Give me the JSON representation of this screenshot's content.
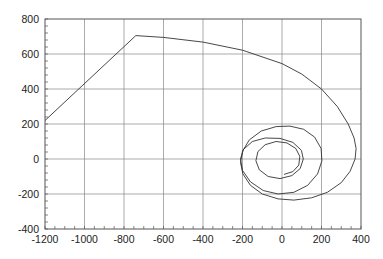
{
  "chart_data": {
    "type": "line",
    "title": "",
    "xlabel": "",
    "ylabel": "",
    "xlim": [
      -1200,
      400
    ],
    "ylim": [
      -400,
      800
    ],
    "xticks": [
      -1200,
      -1000,
      -800,
      -600,
      -400,
      -200,
      0,
      200,
      400
    ],
    "yticks": [
      -400,
      -200,
      0,
      200,
      400,
      600,
      800
    ],
    "x_minor_step": 50,
    "y_minor_step": 40,
    "grid": true,
    "legend": null,
    "colors": {
      "line": "#333333",
      "grid": "#888888",
      "frame": "#555555",
      "background": "#ffffff"
    },
    "series": [
      {
        "name": "trajectory",
        "points": [
          [
            -1200,
            220
          ],
          [
            -740,
            705
          ],
          [
            -600,
            695
          ],
          [
            -400,
            668
          ],
          [
            -200,
            622
          ],
          [
            0,
            545
          ],
          [
            100,
            485
          ],
          [
            200,
            400
          ],
          [
            280,
            300
          ],
          [
            335,
            200
          ],
          [
            365,
            120
          ],
          [
            375,
            60
          ],
          [
            370,
            0
          ],
          [
            345,
            -70
          ],
          [
            300,
            -135
          ],
          [
            230,
            -190
          ],
          [
            150,
            -222
          ],
          [
            60,
            -235
          ],
          [
            -20,
            -228
          ],
          [
            -100,
            -200
          ],
          [
            -160,
            -150
          ],
          [
            -198,
            -85
          ],
          [
            -210,
            -20
          ],
          [
            -200,
            45
          ],
          [
            -165,
            110
          ],
          [
            -105,
            160
          ],
          [
            -30,
            185
          ],
          [
            40,
            188
          ],
          [
            110,
            170
          ],
          [
            165,
            125
          ],
          [
            198,
            60
          ],
          [
            202,
            -10
          ],
          [
            180,
            -85
          ],
          [
            130,
            -150
          ],
          [
            60,
            -190
          ],
          [
            -20,
            -200
          ],
          [
            -95,
            -180
          ],
          [
            -160,
            -130
          ],
          [
            -200,
            -65
          ],
          [
            -210,
            0
          ],
          [
            -195,
            55
          ],
          [
            -150,
            100
          ],
          [
            -85,
            120
          ],
          [
            -10,
            118
          ],
          [
            55,
            95
          ],
          [
            98,
            50
          ],
          [
            108,
            0
          ],
          [
            92,
            -55
          ],
          [
            50,
            -95
          ],
          [
            -10,
            -112
          ],
          [
            -70,
            -100
          ],
          [
            -115,
            -62
          ],
          [
            -132,
            -10
          ],
          [
            -122,
            42
          ],
          [
            -85,
            82
          ],
          [
            -30,
            100
          ],
          [
            25,
            92
          ],
          [
            70,
            60
          ],
          [
            90,
            15
          ],
          [
            85,
            -35
          ],
          [
            55,
            -72
          ],
          [
            10,
            -88
          ]
        ]
      }
    ]
  }
}
